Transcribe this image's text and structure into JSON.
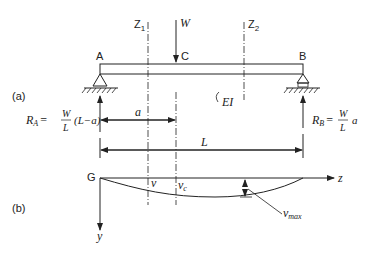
{
  "labels": {
    "part_a": "(a)",
    "part_b": "(b)",
    "point_a": "A",
    "point_b": "B",
    "point_c": "C",
    "point_g": "G",
    "section_z1": "Z",
    "section_z1_sub": "1",
    "section_z2": "Z",
    "section_z2_sub": "2",
    "load": "W",
    "rigidity": "EI",
    "dim_a": "a",
    "dim_l": "L",
    "axis_z": "z",
    "axis_y": "y",
    "defl_v": "v",
    "defl_vc": "v",
    "defl_vc_sub": "c",
    "defl_vmax": "v",
    "defl_vmax_sub": "max"
  },
  "reactions": {
    "ra_lhs": "R",
    "ra_sub": "A",
    "ra_eq": "=",
    "ra_num": "W",
    "ra_den": "L",
    "ra_tail": "(L−a)",
    "rb_lhs": "R",
    "rb_sub": "B",
    "rb_eq": "=",
    "rb_num": "W",
    "rb_den": "L",
    "rb_tail": "a"
  }
}
